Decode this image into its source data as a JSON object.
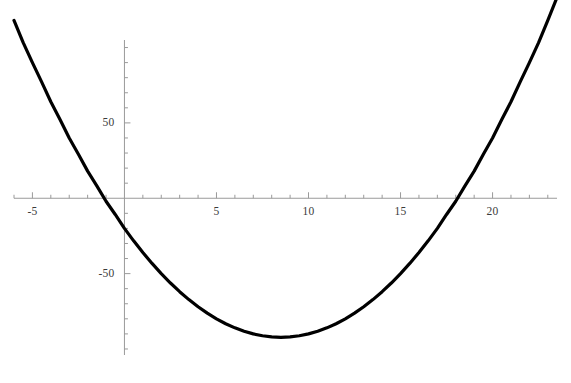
{
  "chart_data": {
    "type": "line",
    "title": "",
    "subtitle": "",
    "xlabel": "",
    "ylabel": "",
    "legend": [],
    "legend_position": "none",
    "grid": false,
    "background_color": "#ffffff",
    "curve_color": "#000000",
    "axis_color": "#9a9a9a",
    "tick_label_color": "#3b3b3b",
    "curve_width_px": 3.2,
    "axis_width_px": 1,
    "function": "y = x^2 - 17x - 20",
    "coefficients": {
      "a": 1,
      "b": -17,
      "c": -20
    },
    "vertex": {
      "x": 8.5,
      "y": -92.25
    },
    "roots": [
      -1.13,
      17.63
    ],
    "xlim": [
      -6.0,
      23.5
    ],
    "ylim": [
      -104,
      105
    ],
    "x_axis_position": 0,
    "y_axis_position": 0,
    "xticks_major": [
      -5,
      5,
      10,
      15,
      20
    ],
    "xtick_labels": [
      "-5",
      "5",
      "10",
      "15",
      "20"
    ],
    "xticks_minor_step": 1,
    "yticks_major": [
      50,
      -50
    ],
    "ytick_labels": [
      "50",
      "-50"
    ],
    "yticks_minor_step": 10,
    "x": [
      -6.0,
      -5.5,
      -5.0,
      -4.5,
      -4.0,
      -3.5,
      -3.0,
      -2.5,
      -2.0,
      -1.5,
      -1.0,
      -0.5,
      0.0,
      0.5,
      1.0,
      1.5,
      2.0,
      2.5,
      3.0,
      3.5,
      4.0,
      4.5,
      5.0,
      5.5,
      6.0,
      6.5,
      7.0,
      7.5,
      8.0,
      8.5,
      9.0,
      9.5,
      10.0,
      10.5,
      11.0,
      11.5,
      12.0,
      12.5,
      13.0,
      13.5,
      14.0,
      14.5,
      15.0,
      15.5,
      16.0,
      16.5,
      17.0,
      17.5,
      18.0,
      18.5,
      19.0,
      19.5,
      20.0,
      20.5,
      21.0,
      21.5,
      22.0,
      22.5,
      23.0,
      23.5
    ],
    "y": [
      118,
      103.25,
      90,
      77.25,
      64,
      52.25,
      40,
      29.25,
      18,
      8.25,
      -2,
      -10.75,
      -20,
      -28.25,
      -36,
      -43.25,
      -50,
      -56.25,
      -62,
      -67.25,
      -72,
      -76.25,
      -80,
      -83.25,
      -86,
      -88.25,
      -90,
      -91.25,
      -92,
      -92.25,
      -92,
      -91.25,
      -90,
      -88.25,
      -86,
      -83.25,
      -80,
      -76.25,
      -72,
      -67.25,
      -62,
      -56.25,
      -50,
      -43.25,
      -36,
      -28.25,
      -20,
      -10.75,
      -2,
      8.25,
      18,
      29.25,
      40,
      52.25,
      64,
      77.25,
      90,
      103.25,
      118,
      133.25
    ]
  },
  "figure": {
    "name": "parabola-plot",
    "width": 571,
    "height": 383
  }
}
